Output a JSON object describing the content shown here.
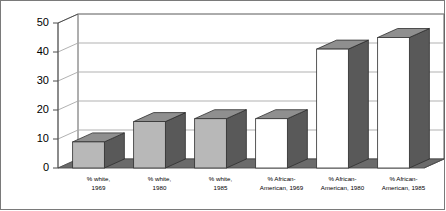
{
  "chart_data": {
    "type": "bar",
    "title": "",
    "xlabel": "",
    "ylabel": "",
    "categories": [
      "% white, 1969",
      "% white, 1980",
      "% white, 1985",
      "% African-American, 1969",
      "% African-American, 1980",
      "% African-American, 1985"
    ],
    "category_lines": [
      [
        "% white,",
        "1969"
      ],
      [
        "% white,",
        "1980"
      ],
      [
        "% white,",
        "1985"
      ],
      [
        "% African-",
        "American, 1969"
      ],
      [
        "% African-",
        "American, 1980"
      ],
      [
        "% African-",
        "American, 1985"
      ]
    ],
    "values": [
      9,
      16,
      17,
      17,
      41,
      45
    ],
    "ylim": [
      0,
      50
    ],
    "yticks": [
      0,
      10,
      20,
      30,
      40,
      50
    ],
    "ytick_labels": [
      "0",
      "10",
      "20",
      "30",
      "40",
      "50"
    ],
    "grid": true,
    "legend": false,
    "style": "3d-column",
    "bar_front_colors": [
      "#b8b8b8",
      "#b8b8b8",
      "#b8b8b8",
      "#ffffff",
      "#ffffff",
      "#ffffff"
    ],
    "colors": {
      "bar_front_gray": "#b8b8b8",
      "bar_front_white": "#ffffff",
      "bar_side": "#595959",
      "bar_top": "#8f8f8f",
      "floor": "#6b6b6b",
      "wall": "#ffffff",
      "gridline": "#a8a8a8",
      "axis": "#4d4d4d",
      "border": "#7a7a7a",
      "text": "#000000"
    }
  }
}
